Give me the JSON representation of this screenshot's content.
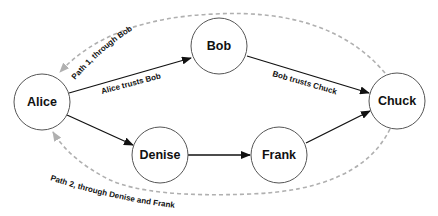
{
  "diagram": {
    "nodes": [
      {
        "id": "alice",
        "label": "Alice",
        "cx": 42,
        "cy": 102
      },
      {
        "id": "bob",
        "label": "Bob",
        "cx": 219,
        "cy": 46
      },
      {
        "id": "chuck",
        "label": "Chuck",
        "cx": 397,
        "cy": 101
      },
      {
        "id": "denise",
        "label": "Denise",
        "cx": 160,
        "cy": 155
      },
      {
        "id": "frank",
        "label": "Frank",
        "cx": 279,
        "cy": 155
      }
    ],
    "edges": [
      {
        "from": "alice",
        "to": "bob",
        "label": "Alice trusts Bob"
      },
      {
        "from": "bob",
        "to": "chuck",
        "label": "Bob trusts Chuck"
      },
      {
        "from": "alice",
        "to": "denise",
        "label": ""
      },
      {
        "from": "denise",
        "to": "frank",
        "label": ""
      },
      {
        "from": "frank",
        "to": "chuck",
        "label": ""
      }
    ],
    "paths": [
      {
        "id": "path1",
        "label": "Path 1, through Bob",
        "style": "dashed",
        "color": "#aaaaaa"
      },
      {
        "id": "path2",
        "label": "Path 2, through Denise and Frank",
        "style": "dashed",
        "color": "#aaaaaa"
      }
    ],
    "colors": {
      "edge": "#111111",
      "node_stroke": "#555555",
      "path": "#aaaaaa"
    }
  }
}
